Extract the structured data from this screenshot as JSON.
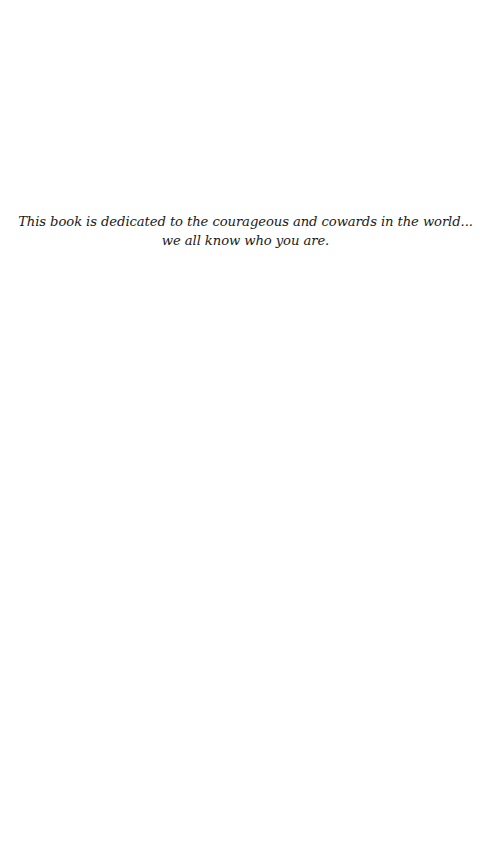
{
  "page": {
    "type": "dedication",
    "background": "#ffffff",
    "text_color": "#1a1a1a"
  },
  "dedication": {
    "lines": [
      "This book is dedicated to the courageous and cowards in the world...",
      "we all know who you are."
    ]
  }
}
